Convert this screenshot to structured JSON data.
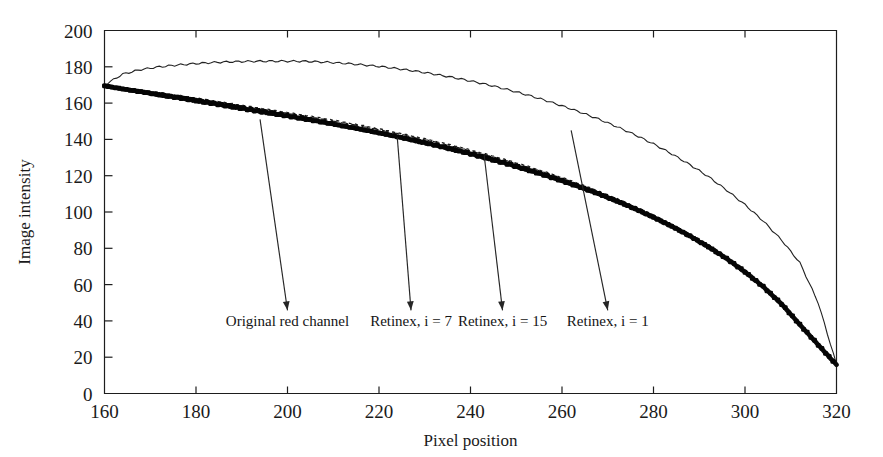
{
  "chart_data": {
    "type": "line",
    "title": "",
    "xlabel": "Pixel position",
    "ylabel": "Image intensity",
    "xlim": [
      160,
      320
    ],
    "ylim": [
      0,
      200
    ],
    "xticks": [
      160,
      180,
      200,
      220,
      240,
      260,
      280,
      300,
      320
    ],
    "yticks": [
      0,
      20,
      40,
      60,
      80,
      100,
      120,
      140,
      160,
      180,
      200
    ],
    "grid": false,
    "legend_position": "none",
    "annotations": [
      {
        "text": "Original red channel",
        "label_x": 200,
        "label_y": 37,
        "points_to_x": 194,
        "points_to_y": 151,
        "series": "Original red channel"
      },
      {
        "text": "Retinex, i = 7",
        "label_x": 227,
        "label_y": 37,
        "points_to_x": 224,
        "points_to_y": 141,
        "series": "Retinex, i = 7"
      },
      {
        "text": "Retinex, i = 15",
        "label_x": 247,
        "label_y": 37,
        "points_to_x": 243,
        "points_to_y": 131,
        "series": "Retinex, i = 15"
      },
      {
        "text": "Retinex, i = 1",
        "label_x": 270,
        "label_y": 37,
        "points_to_x": 262,
        "points_to_y": 145,
        "series": "Retinex, i = 1"
      }
    ],
    "x": [
      160,
      164,
      168,
      172,
      176,
      180,
      184,
      188,
      192,
      196,
      200,
      204,
      208,
      212,
      216,
      220,
      224,
      228,
      232,
      236,
      240,
      244,
      248,
      252,
      256,
      260,
      264,
      268,
      272,
      276,
      280,
      284,
      288,
      292,
      296,
      300,
      304,
      308,
      312,
      316,
      320
    ],
    "series": [
      {
        "name": "Retinex, i = 1",
        "style": "thin-solid",
        "values": [
          170,
          176,
          178.5,
          180,
          181,
          181.8,
          182.4,
          182.8,
          183,
          183.1,
          183.1,
          183,
          182.6,
          182,
          181.2,
          180.2,
          179,
          177.6,
          176,
          174.2,
          172.2,
          170,
          167.5,
          164.8,
          161.8,
          158.5,
          155,
          151.2,
          147,
          142.5,
          137.5,
          132,
          126,
          119.5,
          112,
          104,
          95,
          84.5,
          72,
          50,
          16
        ]
      },
      {
        "name": "Retinex, i = 15",
        "style": "thin-dotted",
        "values": [
          169.8,
          168.5,
          167.2,
          165.8,
          164.3,
          162.8,
          161.2,
          159.6,
          158,
          156.4,
          154.8,
          153.2,
          151.5,
          149.7,
          147.8,
          145.8,
          143.7,
          141.5,
          139.2,
          136.8,
          134.2,
          131.5,
          128.6,
          125.6,
          122.4,
          119,
          115.4,
          111.5,
          107.4,
          103,
          98.3,
          93.2,
          87.7,
          81.7,
          75,
          67.6,
          59.2,
          49.5,
          38,
          27,
          16
        ]
      },
      {
        "name": "Retinex, i = 7",
        "style": "thin-dashed",
        "values": [
          169.7,
          168.3,
          167.0,
          165.5,
          164.0,
          162.5,
          160.9,
          159.3,
          157.6,
          156.0,
          154.4,
          152.7,
          151.0,
          149.2,
          147.3,
          145.3,
          143.2,
          141.0,
          138.7,
          136.3,
          133.7,
          131.0,
          128.1,
          125.1,
          121.9,
          118.5,
          114.9,
          111.0,
          106.9,
          102.5,
          97.8,
          92.7,
          87.2,
          81.2,
          74.6,
          67.2,
          58.8,
          49.1,
          37.8,
          26.8,
          16
        ]
      },
      {
        "name": "Original red channel",
        "style": "thick-markers",
        "values": [
          169.5,
          167.8,
          166.2,
          164.6,
          163.0,
          161.4,
          159.7,
          158.0,
          156.3,
          154.6,
          152.9,
          151.2,
          149.4,
          147.5,
          145.6,
          143.6,
          141.5,
          139.3,
          137.0,
          134.6,
          132.1,
          129.4,
          126.6,
          123.6,
          120.5,
          117.2,
          113.7,
          110.0,
          106.0,
          101.7,
          97.1,
          92.1,
          86.7,
          80.8,
          74.3,
          67.0,
          58.8,
          49.3,
          37.9,
          26.8,
          15.8
        ]
      }
    ]
  }
}
